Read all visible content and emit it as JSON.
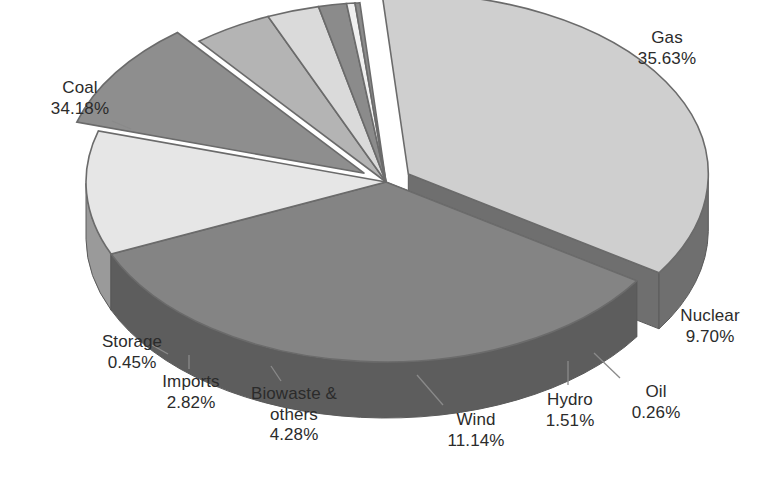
{
  "chart_data": {
    "type": "pie",
    "title": "",
    "subtitle": "",
    "xlabel": "",
    "ylabel": "",
    "grid": false,
    "legend_position": "none",
    "style": "3d-exploded-pie",
    "value_unit": "percent",
    "categories": [
      "Gas",
      "Coal",
      "Wind",
      "Nuclear",
      "Biowaste & others",
      "Imports",
      "Hydro",
      "Storage",
      "Oil"
    ],
    "values": [
      35.63,
      34.18,
      11.14,
      9.7,
      4.28,
      2.82,
      1.51,
      0.45,
      0.26
    ],
    "slices": [
      {
        "name": "Gas",
        "label": "Gas",
        "value": 35.63,
        "value_text": "35.63%",
        "color": "#cfcfcf",
        "side_color": "#6f6f6f",
        "exploded": true
      },
      {
        "name": "Coal",
        "label": "Coal",
        "value": 34.18,
        "value_text": "34.18%",
        "color": "#848484",
        "side_color": "#5d5d5d",
        "exploded": false
      },
      {
        "name": "Wind",
        "label": "Wind",
        "value": 11.14,
        "value_text": "11.14%",
        "color": "#e6e6e6",
        "side_color": "#9a9a9a",
        "exploded": false
      },
      {
        "name": "Nuclear",
        "label": "Nuclear",
        "value": 9.7,
        "value_text": "9.70%",
        "color": "#8e8e8e",
        "side_color": "#5a5a5a",
        "exploded": true
      },
      {
        "name": "Biowaste & others",
        "label": "Biowaste &\nothers",
        "value": 4.28,
        "value_text": "4.28%",
        "color": "#b4b4b4",
        "side_color": "#828282",
        "exploded": false
      },
      {
        "name": "Imports",
        "label": "Imports",
        "value": 2.82,
        "value_text": "2.82%",
        "color": "#dadada",
        "side_color": "#a6a6a6",
        "exploded": false
      },
      {
        "name": "Hydro",
        "label": "Hydro",
        "value": 1.51,
        "value_text": "1.51%",
        "color": "#8b8b8b",
        "side_color": "#616161",
        "exploded": false
      },
      {
        "name": "Storage",
        "label": "Storage",
        "value": 0.45,
        "value_text": "0.45%",
        "color": "#f0f0f0",
        "side_color": "#bdbdbd",
        "exploded": false
      },
      {
        "name": "Oil",
        "label": "Oil",
        "value": 0.26,
        "value_text": "0.26%",
        "color": "#8b8b8b",
        "side_color": "#616161",
        "exploded": false
      }
    ],
    "labels": [
      {
        "key": "gas",
        "name": "Gas",
        "value_text": "35.63%",
        "x": 602,
        "y": 28,
        "w": 130,
        "align": "center"
      },
      {
        "key": "coal",
        "name": "Coal",
        "value_text": "34.18%",
        "x": 20,
        "y": 78,
        "w": 120,
        "align": "center"
      },
      {
        "key": "nuclear",
        "name": "Nuclear",
        "value_text": "9.70%",
        "x": 660,
        "y": 306,
        "w": 100,
        "align": "center"
      },
      {
        "key": "oil",
        "name": "Oil",
        "value_text": "0.26%",
        "x": 614,
        "y": 382,
        "w": 84,
        "align": "center"
      },
      {
        "key": "hydro",
        "name": "Hydro",
        "value_text": "1.51%",
        "x": 528,
        "y": 390,
        "w": 84,
        "align": "center"
      },
      {
        "key": "wind",
        "name": "Wind",
        "value_text": "11.14%",
        "x": 430,
        "y": 410,
        "w": 92,
        "align": "center"
      },
      {
        "key": "biowaste",
        "name": "Biowaste &\nothers",
        "value_text": "4.28%",
        "x": 230,
        "y": 384,
        "w": 128,
        "align": "center"
      },
      {
        "key": "imports",
        "name": "Imports",
        "value_text": "2.82%",
        "x": 143,
        "y": 372,
        "w": 96,
        "align": "center"
      },
      {
        "key": "storage",
        "name": "Storage",
        "value_text": "0.45%",
        "x": 80,
        "y": 332,
        "w": 104,
        "align": "center"
      }
    ],
    "leader_lines": [
      {
        "name": "coal-leader",
        "x1": 112,
        "y1": 121,
        "x2": 131,
        "y2": 129
      },
      {
        "name": "storage-leader",
        "x1": 152,
        "y1": 345,
        "x2": 168,
        "y2": 354
      },
      {
        "name": "imports-leader",
        "x1": 189,
        "y1": 369,
        "x2": 189,
        "y2": 355
      },
      {
        "name": "biowaste-leader",
        "x1": 281,
        "y1": 381,
        "x2": 271,
        "y2": 366
      },
      {
        "name": "wind-leader",
        "x1": 443,
        "y1": 405,
        "x2": 417,
        "y2": 375
      },
      {
        "name": "hydro-leader",
        "x1": 568,
        "y1": 385,
        "x2": 568,
        "y2": 361
      },
      {
        "name": "oil-leader",
        "x1": 620,
        "y1": 378,
        "x2": 594,
        "y2": 353
      }
    ]
  },
  "colors": {
    "background": "#ffffff",
    "text": "#2b2b2b",
    "leader": "#8a8a8a"
  }
}
